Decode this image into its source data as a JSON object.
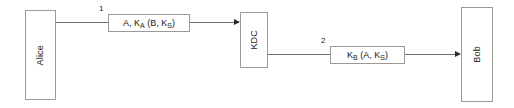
{
  "diagram": {
    "background_color": "#ffffff",
    "node_border_color": "#9a9a9a",
    "line_color": "#6e6e6e",
    "arrow_color": "#2b2b2b",
    "text_color": "#1a1a1a",
    "nodes": [
      {
        "id": "alice",
        "label": "Alice",
        "orientation": "vertical"
      },
      {
        "id": "kdc",
        "label": "KDC",
        "orientation": "vertical"
      },
      {
        "id": "bob",
        "label": "Bob",
        "orientation": "vertical"
      }
    ],
    "messages": [
      {
        "step": "1",
        "from": "alice",
        "to": "kdc",
        "text": "A, K_A (B, K_S)",
        "parts": [
          {
            "t": "A, K",
            "sub": false
          },
          {
            "t": "A",
            "sub": true
          },
          {
            "t": " (B, K",
            "sub": false
          },
          {
            "t": "S",
            "sub": true
          },
          {
            "t": ")",
            "sub": false
          }
        ]
      },
      {
        "step": "2",
        "from": "kdc",
        "to": "bob",
        "text": "K_B (A, K_S)",
        "parts": [
          {
            "t": "K",
            "sub": false
          },
          {
            "t": "B",
            "sub": true
          },
          {
            "t": " (A, K",
            "sub": false
          },
          {
            "t": "S",
            "sub": true
          },
          {
            "t": ")",
            "sub": false
          }
        ]
      }
    ]
  }
}
